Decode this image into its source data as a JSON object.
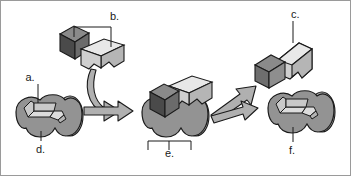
{
  "figure": {
    "width": 351,
    "height": 176,
    "background_color": "#ffffff",
    "border_color": "#9a9a9a"
  },
  "labels": [
    {
      "id": "a",
      "text": "a.",
      "x": 30,
      "y": 81,
      "leader": {
        "x1": 38,
        "y1": 84,
        "x2": 38,
        "y2": 103
      }
    },
    {
      "id": "b",
      "text": "b.",
      "x": 110,
      "y": 20,
      "leader": {
        "x1": 111,
        "y1": 23,
        "x2": 111,
        "y2": 47
      }
    },
    {
      "id": "c",
      "text": "c.",
      "x": 291,
      "y": 18,
      "leader": {
        "x1": 293,
        "y1": 21,
        "x2": 293,
        "y2": 43
      }
    },
    {
      "id": "d",
      "text": "d.",
      "x": 36,
      "y": 153,
      "leader": {
        "x1": 41,
        "y1": 141,
        "x2": 41,
        "y2": 131
      }
    },
    {
      "id": "e",
      "text": "e.",
      "x": 165,
      "y": 157,
      "leader": null
    },
    {
      "id": "f",
      "text": "f.",
      "x": 289,
      "y": 154,
      "leader": {
        "x1": 293,
        "y1": 142,
        "x2": 293,
        "y2": 127
      }
    }
  ],
  "brackets": [
    {
      "id": "bracket-b",
      "for": "b",
      "x1": 74,
      "y1": 27,
      "x2": 111,
      "y2": 27,
      "drop_left": 10,
      "drop_right": 0,
      "note": "bracket linking the two free substrates to label b."
    },
    {
      "id": "bracket-e",
      "for": "e",
      "x1": 148,
      "y1": 141,
      "x2": 191,
      "y2": 141,
      "drop_left": 9,
      "drop_right": 9,
      "note": "bracket spanning the enzyme-substrate complex, label e."
    }
  ],
  "colors": {
    "enzyme_body": "#939393",
    "enzyme_body_dark": "#858585",
    "enzyme_highlight": "#b4b4b4",
    "enzyme_site_face": "#c9c9c9",
    "enzyme_site_light": "#dcdcdc",
    "substrate_dark_front": "#4a4a4a",
    "substrate_dark_top": "#8a8a8a",
    "substrate_dark_side": "#6b6b6b",
    "substrate_light_front": "#cfcfcf",
    "substrate_light_top": "#e8e8e8",
    "substrate_light_side": "#b5b5b5",
    "arrow_fill": "#b0b0b0",
    "outline": "#1a1a1a",
    "label_text": "#1a1a1a"
  },
  "parts": [
    {
      "name": "active-site",
      "label_ref": "a"
    },
    {
      "name": "substrates",
      "label_ref": "b"
    },
    {
      "name": "product",
      "label_ref": "c"
    },
    {
      "name": "enzyme-free",
      "label_ref": "d"
    },
    {
      "name": "enzyme-substrate-complex",
      "label_ref": "e"
    },
    {
      "name": "enzyme-unchanged",
      "label_ref": "f"
    }
  ],
  "arrows": [
    {
      "name": "substrate-binding-curve",
      "from": "substrates",
      "to": "enzyme-substrate-complex"
    },
    {
      "name": "reaction-arrow",
      "from": "enzyme-free",
      "to": "enzyme-substrate-complex"
    },
    {
      "name": "product-release-arrow",
      "from": "enzyme-substrate-complex",
      "to": "product"
    },
    {
      "name": "enzyme-release-arrow",
      "from": "enzyme-substrate-complex",
      "to": "enzyme-unchanged"
    }
  ]
}
